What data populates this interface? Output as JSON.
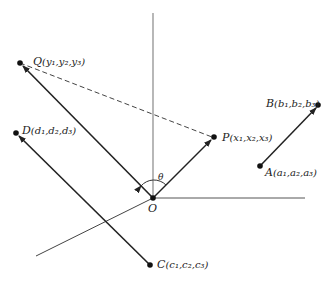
{
  "diagram": {
    "origin": {
      "label": "O",
      "x": 153,
      "y": 198
    },
    "angle_label": "θ",
    "axes": {
      "vertical": {
        "x1": 153,
        "y1": 13,
        "x2": 153,
        "y2": 198
      },
      "horizontal": {
        "x1": 153,
        "y1": 198,
        "x2": 305,
        "y2": 198
      },
      "oblique": {
        "x1": 153,
        "y1": 198,
        "x2": 36,
        "y2": 256
      }
    },
    "points": {
      "Q": {
        "name": "Q",
        "coords": "(y₁,y₂,y₃)",
        "x": 20,
        "y": 63
      },
      "P": {
        "name": "P",
        "coords": "(x₁,x₂,x₃)",
        "x": 214,
        "y": 137
      },
      "D": {
        "name": "D",
        "coords": "(d₁,d₂,d₃)",
        "x": 16,
        "y": 133
      },
      "C": {
        "name": "C",
        "coords": "(c₁,c₂,c₃)",
        "x": 150,
        "y": 265
      },
      "A": {
        "name": "A",
        "coords": "(a₁,a₂,a₃)",
        "x": 260,
        "y": 166
      },
      "B": {
        "name": "B",
        "coords": "(b₁,b₂,b₃)",
        "x": 318,
        "y": 105
      }
    },
    "vectors": [
      {
        "from": "O",
        "to": "Q",
        "style": "solid-arrow"
      },
      {
        "from": "O",
        "to": "P",
        "style": "solid-arrow"
      },
      {
        "from": "C",
        "to": "D",
        "style": "solid-arrow"
      },
      {
        "from": "A",
        "to": "B",
        "style": "solid-arrow"
      },
      {
        "from": "Q",
        "to": "P",
        "style": "dashed"
      }
    ]
  }
}
